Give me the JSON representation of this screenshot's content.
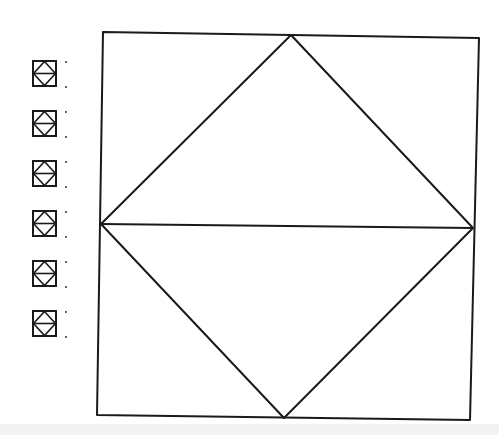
{
  "colors": {
    "background": "#ffffff",
    "stroke": "#1a1a1a",
    "bottom_band": "#f3f3f3"
  },
  "main_diagram": {
    "description": "Square with inscribed rhombus (diamond) and horizontal diagonal",
    "square": {
      "top_left": [
        103,
        32
      ],
      "top_right": [
        479,
        38
      ],
      "bottom_right": [
        470,
        420
      ],
      "bottom_left": [
        97,
        415
      ]
    },
    "diamond": {
      "top": [
        291,
        35
      ],
      "right": [
        473,
        228
      ],
      "bottom": [
        284,
        418
      ],
      "left": [
        101,
        224
      ]
    },
    "horizontal_line": {
      "from": [
        101,
        224
      ],
      "to": [
        473,
        228
      ]
    },
    "stroke_width": 2
  },
  "thumbnails": [
    {
      "id": 1,
      "x": 32,
      "y": 60
    },
    {
      "id": 2,
      "x": 32,
      "y": 110
    },
    {
      "id": 3,
      "x": 32,
      "y": 160
    },
    {
      "id": 4,
      "x": 32,
      "y": 210
    },
    {
      "id": 5,
      "x": 32,
      "y": 260
    },
    {
      "id": 6,
      "x": 32,
      "y": 310
    }
  ]
}
